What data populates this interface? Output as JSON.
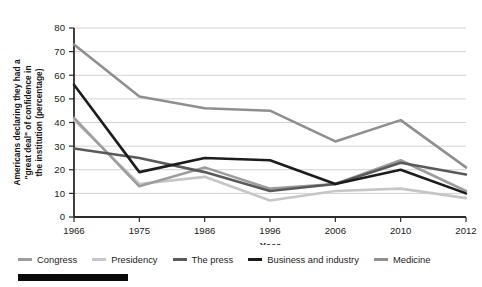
{
  "chart_data": {
    "type": "line",
    "title": "",
    "xlabel": "Year",
    "ylabel": "Americans declaring they had a \"great deal\" of confidence in the institution (percentage)",
    "categories": [
      "1966",
      "1975",
      "1986",
      "1996",
      "2006",
      "2010",
      "2012"
    ],
    "ylim": [
      0,
      80
    ],
    "ytick_step": 10,
    "yticks": [
      "0",
      "10",
      "20",
      "30",
      "40",
      "50",
      "60",
      "70",
      "80"
    ],
    "grid": true,
    "legend_position": "bottom",
    "series": [
      {
        "name": "Congress",
        "color": "#9d9d9d",
        "values": [
          42,
          13,
          21,
          12,
          14,
          24,
          11
        ]
      },
      {
        "name": "Presidency",
        "color": "#c6c6c6",
        "values": [
          41,
          14,
          17,
          7,
          11,
          12,
          8
        ]
      },
      {
        "name": "The press",
        "color": "#5a5a5a",
        "values": [
          29,
          25,
          19,
          11,
          14,
          23,
          18
        ]
      },
      {
        "name": "Business and industry",
        "color": "#1c1c1c",
        "values": [
          56,
          19,
          25,
          24,
          14,
          20,
          10
        ]
      },
      {
        "name": "Medicine",
        "color": "#8f8f8f",
        "values": [
          73,
          51,
          46,
          45,
          32,
          41,
          21
        ]
      }
    ]
  },
  "axis": {
    "ylabel_lines": [
      "Americans declaring they had a",
      "\"great deal\" of confidence in",
      "the institution (percentage)"
    ],
    "xlabel": "Year"
  },
  "colors": {
    "axis": "#2b2b2b",
    "grid": "#d2d2d2",
    "text": "#1a1a1a",
    "footer_bar": "#0a0a0a"
  }
}
